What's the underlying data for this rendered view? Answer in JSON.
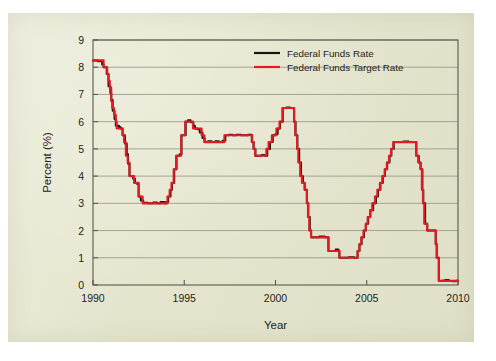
{
  "chart_data": {
    "type": "line",
    "title": "",
    "xlabel": "Year",
    "ylabel": "Percent (%)",
    "xlim": [
      1990,
      2010
    ],
    "ylim": [
      0,
      9
    ],
    "grid": "horizontal",
    "legend_position": "top-right",
    "xticks": [
      1990,
      1995,
      2000,
      2005,
      2010
    ],
    "xtick_labels": [
      "1990",
      "1995",
      "2000",
      "2005",
      "2010"
    ],
    "yticks": [
      0,
      1,
      2,
      3,
      4,
      5,
      6,
      7,
      8,
      9
    ],
    "ytick_labels": [
      "0",
      "1",
      "2",
      "3",
      "4",
      "5",
      "6",
      "7",
      "8",
      "9"
    ],
    "series": [
      {
        "name": "Federal Funds Rate",
        "color": "#17170f",
        "points": [
          [
            1990.0,
            8.25
          ],
          [
            1990.25,
            8.22
          ],
          [
            1990.5,
            8.1
          ],
          [
            1990.58,
            8.0
          ],
          [
            1990.62,
            8.0
          ],
          [
            1990.75,
            7.75
          ],
          [
            1990.85,
            7.3
          ],
          [
            1990.95,
            7.05
          ],
          [
            1991.0,
            6.8
          ],
          [
            1991.08,
            6.4
          ],
          [
            1991.18,
            6.1
          ],
          [
            1991.25,
            5.85
          ],
          [
            1991.42,
            5.8
          ],
          [
            1991.5,
            5.75
          ],
          [
            1991.62,
            5.5
          ],
          [
            1991.75,
            5.2
          ],
          [
            1991.85,
            4.8
          ],
          [
            1991.92,
            4.45
          ],
          [
            1992.0,
            4.0
          ],
          [
            1992.12,
            4.0
          ],
          [
            1992.2,
            3.9
          ],
          [
            1992.3,
            3.75
          ],
          [
            1992.4,
            3.72
          ],
          [
            1992.5,
            3.25
          ],
          [
            1992.62,
            3.1
          ],
          [
            1992.75,
            3.02
          ],
          [
            1993.0,
            3.0
          ],
          [
            1993.3,
            3.03
          ],
          [
            1993.5,
            3.0
          ],
          [
            1993.7,
            3.05
          ],
          [
            1993.9,
            3.0
          ],
          [
            1994.0,
            3.05
          ],
          [
            1994.12,
            3.25
          ],
          [
            1994.25,
            3.5
          ],
          [
            1994.33,
            3.75
          ],
          [
            1994.45,
            4.25
          ],
          [
            1994.58,
            4.75
          ],
          [
            1994.75,
            4.8
          ],
          [
            1994.85,
            5.5
          ],
          [
            1995.0,
            5.5
          ],
          [
            1995.08,
            6.0
          ],
          [
            1995.2,
            6.05
          ],
          [
            1995.35,
            5.98
          ],
          [
            1995.5,
            5.85
          ],
          [
            1995.58,
            5.75
          ],
          [
            1995.72,
            5.72
          ],
          [
            1995.85,
            5.6
          ],
          [
            1996.0,
            5.4
          ],
          [
            1996.12,
            5.25
          ],
          [
            1996.3,
            5.28
          ],
          [
            1996.5,
            5.25
          ],
          [
            1996.7,
            5.28
          ],
          [
            1996.9,
            5.25
          ],
          [
            1997.1,
            5.3
          ],
          [
            1997.25,
            5.5
          ],
          [
            1997.45,
            5.52
          ],
          [
            1997.65,
            5.5
          ],
          [
            1997.85,
            5.52
          ],
          [
            1998.1,
            5.5
          ],
          [
            1998.3,
            5.5
          ],
          [
            1998.5,
            5.52
          ],
          [
            1998.7,
            5.25
          ],
          [
            1998.8,
            5.0
          ],
          [
            1998.9,
            4.75
          ],
          [
            1999.05,
            4.75
          ],
          [
            1999.25,
            4.78
          ],
          [
            1999.4,
            4.75
          ],
          [
            1999.55,
            5.0
          ],
          [
            1999.7,
            5.25
          ],
          [
            1999.85,
            5.5
          ],
          [
            2000.0,
            5.55
          ],
          [
            2000.12,
            5.75
          ],
          [
            2000.25,
            6.0
          ],
          [
            2000.4,
            6.5
          ],
          [
            2000.6,
            6.52
          ],
          [
            2000.8,
            6.5
          ],
          [
            2000.95,
            6.5
          ],
          [
            2001.02,
            6.0
          ],
          [
            2001.1,
            5.5
          ],
          [
            2001.2,
            5.0
          ],
          [
            2001.3,
            4.5
          ],
          [
            2001.4,
            4.0
          ],
          [
            2001.5,
            3.75
          ],
          [
            2001.6,
            3.5
          ],
          [
            2001.7,
            3.5
          ],
          [
            2001.72,
            3.0
          ],
          [
            2001.8,
            2.5
          ],
          [
            2001.88,
            2.0
          ],
          [
            2001.95,
            1.75
          ],
          [
            2002.1,
            1.75
          ],
          [
            2002.4,
            1.78
          ],
          [
            2002.7,
            1.75
          ],
          [
            2002.85,
            1.75
          ],
          [
            2002.9,
            1.25
          ],
          [
            2003.1,
            1.25
          ],
          [
            2003.3,
            1.3
          ],
          [
            2003.45,
            1.25
          ],
          [
            2003.5,
            1.0
          ],
          [
            2003.7,
            1.0
          ],
          [
            2004.0,
            1.02
          ],
          [
            2004.3,
            1.0
          ],
          [
            2004.5,
            1.25
          ],
          [
            2004.6,
            1.5
          ],
          [
            2004.72,
            1.75
          ],
          [
            2004.85,
            2.0
          ],
          [
            2004.95,
            2.25
          ],
          [
            2005.08,
            2.5
          ],
          [
            2005.2,
            2.75
          ],
          [
            2005.35,
            3.0
          ],
          [
            2005.5,
            3.25
          ],
          [
            2005.62,
            3.5
          ],
          [
            2005.75,
            3.75
          ],
          [
            2005.88,
            4.0
          ],
          [
            2006.0,
            4.25
          ],
          [
            2006.12,
            4.5
          ],
          [
            2006.25,
            4.75
          ],
          [
            2006.35,
            5.0
          ],
          [
            2006.48,
            5.25
          ],
          [
            2006.7,
            5.25
          ],
          [
            2007.0,
            5.27
          ],
          [
            2007.3,
            5.25
          ],
          [
            2007.6,
            5.25
          ],
          [
            2007.72,
            4.75
          ],
          [
            2007.85,
            4.5
          ],
          [
            2007.95,
            4.25
          ],
          [
            2008.05,
            3.5
          ],
          [
            2008.1,
            3.0
          ],
          [
            2008.2,
            2.25
          ],
          [
            2008.32,
            2.0
          ],
          [
            2008.5,
            2.0
          ],
          [
            2008.7,
            2.0
          ],
          [
            2008.78,
            1.5
          ],
          [
            2008.83,
            1.0
          ],
          [
            2008.95,
            0.15
          ],
          [
            2009.1,
            0.16
          ],
          [
            2009.3,
            0.18
          ],
          [
            2009.5,
            0.15
          ],
          [
            2009.7,
            0.14
          ],
          [
            2009.9,
            0.16
          ],
          [
            2010.0,
            0.15
          ]
        ]
      },
      {
        "name": "Federal Funds Target Rate",
        "color": "#e01b24",
        "points": [
          [
            1990.0,
            8.25
          ],
          [
            1990.3,
            8.25
          ],
          [
            1990.55,
            8.25
          ],
          [
            1990.58,
            8.0
          ],
          [
            1990.7,
            8.0
          ],
          [
            1990.78,
            7.75
          ],
          [
            1990.85,
            7.5
          ],
          [
            1990.92,
            7.25
          ],
          [
            1991.0,
            6.75
          ],
          [
            1991.05,
            6.5
          ],
          [
            1991.15,
            6.25
          ],
          [
            1991.25,
            6.0
          ],
          [
            1991.3,
            5.75
          ],
          [
            1991.45,
            5.75
          ],
          [
            1991.5,
            5.75
          ],
          [
            1991.62,
            5.5
          ],
          [
            1991.7,
            5.25
          ],
          [
            1991.8,
            4.75
          ],
          [
            1991.9,
            4.5
          ],
          [
            1992.0,
            4.0
          ],
          [
            1992.15,
            4.0
          ],
          [
            1992.25,
            3.75
          ],
          [
            1992.45,
            3.75
          ],
          [
            1992.5,
            3.25
          ],
          [
            1992.65,
            3.25
          ],
          [
            1992.72,
            3.0
          ],
          [
            1993.0,
            3.0
          ],
          [
            1993.5,
            3.0
          ],
          [
            1993.95,
            3.0
          ],
          [
            1994.08,
            3.25
          ],
          [
            1994.2,
            3.5
          ],
          [
            1994.3,
            3.75
          ],
          [
            1994.42,
            4.25
          ],
          [
            1994.55,
            4.75
          ],
          [
            1994.72,
            4.75
          ],
          [
            1994.83,
            5.5
          ],
          [
            1995.0,
            5.5
          ],
          [
            1995.05,
            6.0
          ],
          [
            1995.3,
            6.0
          ],
          [
            1995.48,
            5.75
          ],
          [
            1995.7,
            5.75
          ],
          [
            1995.95,
            5.5
          ],
          [
            1996.1,
            5.25
          ],
          [
            1996.5,
            5.25
          ],
          [
            1996.95,
            5.25
          ],
          [
            1997.2,
            5.5
          ],
          [
            1997.6,
            5.5
          ],
          [
            1998.0,
            5.5
          ],
          [
            1998.5,
            5.5
          ],
          [
            1998.72,
            5.25
          ],
          [
            1998.8,
            5.0
          ],
          [
            1998.88,
            4.75
          ],
          [
            1999.3,
            4.75
          ],
          [
            1999.5,
            5.0
          ],
          [
            1999.62,
            5.25
          ],
          [
            1999.8,
            5.5
          ],
          [
            2000.05,
            5.75
          ],
          [
            2000.22,
            6.0
          ],
          [
            2000.38,
            6.5
          ],
          [
            2000.7,
            6.5
          ],
          [
            2000.98,
            6.5
          ],
          [
            2001.02,
            6.0
          ],
          [
            2001.08,
            5.5
          ],
          [
            2001.18,
            5.0
          ],
          [
            2001.25,
            4.5
          ],
          [
            2001.35,
            4.0
          ],
          [
            2001.45,
            3.75
          ],
          [
            2001.55,
            3.75
          ],
          [
            2001.6,
            3.5
          ],
          [
            2001.7,
            3.5
          ],
          [
            2001.72,
            3.0
          ],
          [
            2001.78,
            2.5
          ],
          [
            2001.85,
            2.0
          ],
          [
            2001.95,
            1.75
          ],
          [
            2002.3,
            1.75
          ],
          [
            2002.85,
            1.75
          ],
          [
            2002.9,
            1.25
          ],
          [
            2003.2,
            1.25
          ],
          [
            2003.45,
            1.25
          ],
          [
            2003.5,
            1.0
          ],
          [
            2003.8,
            1.0
          ],
          [
            2004.2,
            1.0
          ],
          [
            2004.45,
            1.0
          ],
          [
            2004.5,
            1.25
          ],
          [
            2004.6,
            1.5
          ],
          [
            2004.7,
            1.75
          ],
          [
            2004.82,
            2.0
          ],
          [
            2004.95,
            2.25
          ],
          [
            2005.05,
            2.5
          ],
          [
            2005.18,
            2.75
          ],
          [
            2005.3,
            3.0
          ],
          [
            2005.45,
            3.25
          ],
          [
            2005.58,
            3.5
          ],
          [
            2005.72,
            3.75
          ],
          [
            2005.85,
            4.0
          ],
          [
            2005.98,
            4.25
          ],
          [
            2006.1,
            4.5
          ],
          [
            2006.22,
            4.75
          ],
          [
            2006.33,
            5.0
          ],
          [
            2006.45,
            5.25
          ],
          [
            2006.8,
            5.25
          ],
          [
            2007.2,
            5.25
          ],
          [
            2007.6,
            5.25
          ],
          [
            2007.7,
            4.75
          ],
          [
            2007.82,
            4.5
          ],
          [
            2007.95,
            4.25
          ],
          [
            2008.02,
            3.5
          ],
          [
            2008.08,
            3.0
          ],
          [
            2008.15,
            2.25
          ],
          [
            2008.3,
            2.0
          ],
          [
            2008.6,
            2.0
          ],
          [
            2008.75,
            2.0
          ],
          [
            2008.78,
            1.5
          ],
          [
            2008.85,
            1.0
          ],
          [
            2008.95,
            0.15
          ],
          [
            2009.3,
            0.15
          ],
          [
            2009.7,
            0.15
          ],
          [
            2010.0,
            0.15
          ]
        ]
      }
    ]
  }
}
